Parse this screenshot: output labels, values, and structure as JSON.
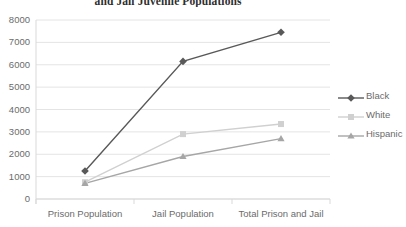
{
  "chart_data": {
    "type": "line",
    "title": "and Jail Juvenile Populations",
    "title_superscript": "2",
    "categories": [
      "Prison Population",
      "Jail Population",
      "Total Prison and Jail"
    ],
    "series": [
      {
        "name": "Black",
        "values": [
          1250,
          6150,
          7450
        ],
        "color": "#595959",
        "marker": "diamond"
      },
      {
        "name": "White",
        "values": [
          750,
          2900,
          3350
        ],
        "color": "#d0d0d0",
        "marker": "square"
      },
      {
        "name": "Hispanic",
        "values": [
          700,
          1900,
          2700
        ],
        "color": "#a6a6a6",
        "marker": "triangle"
      }
    ],
    "xlabel": "",
    "ylabel": "",
    "ylim": [
      0,
      8000
    ],
    "ytick_labels": [
      "0",
      "1000",
      "2000",
      "3000",
      "4000",
      "5000",
      "6000",
      "7000",
      "8000"
    ],
    "ytick_values": [
      0,
      1000,
      2000,
      3000,
      4000,
      5000,
      6000,
      7000,
      8000
    ],
    "grid": true,
    "legend_position": "right",
    "legend_entries": [
      "Black",
      "White",
      "Hispanic"
    ],
    "gridline_color": "#e4e4e4",
    "axis_color": "#d9d9d9",
    "background": "#ffffff"
  }
}
